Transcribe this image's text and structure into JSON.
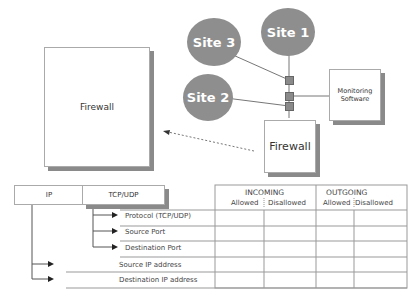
{
  "diagram": {
    "big_firewall": {
      "label": "Firewall"
    },
    "small_firewall": {
      "label": "Firewall"
    },
    "monitoring": {
      "label_line1": "Monitoring",
      "label_line2": "Software"
    },
    "sites": [
      {
        "label": "Site 1"
      },
      {
        "label": "Site 2"
      },
      {
        "label": "Site 3"
      }
    ],
    "colors": {
      "site_fill": "#8e8e8e",
      "shadow": "#8a8a8a",
      "line": "#888888"
    }
  },
  "table": {
    "left_headers": {
      "ip": "IP",
      "tcp_udp": "TCP/UDP"
    },
    "groups": [
      {
        "label": "INCOMING",
        "cols": [
          "Allowed",
          "Disallowed"
        ]
      },
      {
        "label": "OUTGOING",
        "cols": [
          "Allowed",
          "Disallowed"
        ]
      }
    ],
    "rows": [
      {
        "label": "Protocol (TCP/UDP)"
      },
      {
        "label": "Source Port"
      },
      {
        "label": "Destination Port"
      },
      {
        "label": "Source IP address"
      },
      {
        "label": "Destination IP address"
      }
    ]
  }
}
